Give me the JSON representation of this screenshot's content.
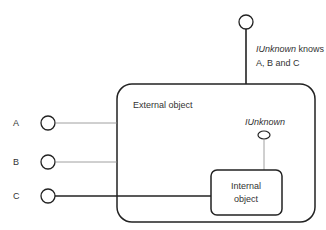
{
  "diagram": {
    "top_note": {
      "italic": "IUnknown",
      "rest": " knows",
      "line2": "A, B and C"
    },
    "outer_box_label": "External object",
    "inner_box_label_line1": "Internal",
    "inner_box_label_line2": "object",
    "inner_interface_label": "IUnknown",
    "interfaces": [
      {
        "label": "A"
      },
      {
        "label": "B"
      },
      {
        "label": "C"
      }
    ],
    "colors": {
      "stroke": "#222222",
      "thin_stroke": "#888888",
      "text": "#333333"
    }
  }
}
